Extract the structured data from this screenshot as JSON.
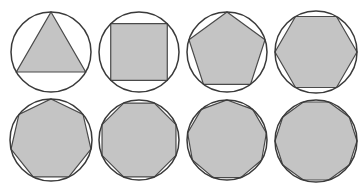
{
  "figure": {
    "width": 363,
    "height": 189,
    "colors": {
      "background": "#ffffff",
      "polygon_fill": "#c4c4c4",
      "polygon_stroke": "#4a4a4a",
      "circle_stroke": "#3a3a3a"
    },
    "rows": 2,
    "columns": 4,
    "items": [
      {
        "name": "triangle",
        "sides": 3,
        "cx": 51,
        "cy": 52,
        "r": 40,
        "rotation_deg": -90
      },
      {
        "name": "square",
        "sides": 4,
        "cx": 139,
        "cy": 52,
        "r": 40,
        "rotation_deg": -45
      },
      {
        "name": "pentagon",
        "sides": 5,
        "cx": 227,
        "cy": 52,
        "r": 40,
        "rotation_deg": -90
      },
      {
        "name": "hexagon",
        "sides": 6,
        "cx": 316,
        "cy": 52,
        "r": 41,
        "rotation_deg": 0
      },
      {
        "name": "heptagon",
        "sides": 7,
        "cx": 51,
        "cy": 140,
        "r": 41,
        "rotation_deg": -90
      },
      {
        "name": "octagon",
        "sides": 8,
        "cx": 139,
        "cy": 140,
        "r": 40,
        "rotation_deg": -67.5
      },
      {
        "name": "nonagon",
        "sides": 9,
        "cx": 227,
        "cy": 140,
        "r": 40,
        "rotation_deg": -90
      },
      {
        "name": "decagon",
        "sides": 10,
        "cx": 316,
        "cy": 141,
        "r": 41,
        "rotation_deg": -72
      }
    ]
  }
}
